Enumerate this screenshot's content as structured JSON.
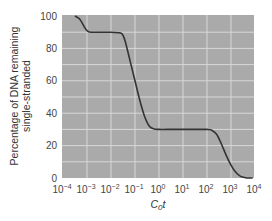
{
  "chart_data": {
    "type": "line",
    "title": "",
    "xlabel": "C0t",
    "ylabel": "Percentage of DNA remaining single-stranded",
    "ylabel_lines": [
      "Percentage of DNA remaining",
      "single-stranded"
    ],
    "x_scale": "log",
    "xlim_log10": [
      -4,
      4
    ],
    "ylim": [
      0,
      100
    ],
    "grid": true,
    "x_ticks": [
      "10^-4",
      "10^-3",
      "10^-2",
      "10^-1",
      "10^0",
      "10^1",
      "10^2",
      "10^3",
      "10^4"
    ],
    "x_tick_exponents": [
      "-4",
      "-3",
      "-2",
      "-1",
      "0",
      "1",
      "2",
      "3",
      "4"
    ],
    "y_ticks": [
      "0",
      "20",
      "40",
      "60",
      "80",
      "100"
    ],
    "series": [
      {
        "name": "Reassociation curve",
        "log10_x": [
          -3.5,
          -3.3,
          -3.1,
          -3.0,
          -2.8,
          -2.0,
          -1.6,
          -1.5,
          -1.4,
          -1.2,
          -1.0,
          -0.8,
          -0.6,
          -0.4,
          -0.2,
          0.0,
          0.5,
          1.0,
          2.0,
          2.2,
          2.4,
          2.6,
          2.8,
          3.0,
          3.2,
          3.4,
          3.6,
          3.8,
          3.9
        ],
        "values": [
          100,
          98,
          93,
          91,
          90,
          90,
          89.5,
          88,
          84,
          72,
          60,
          48,
          38,
          32,
          30.3,
          30,
          30,
          30,
          30,
          29.5,
          27,
          21,
          14,
          8,
          3.5,
          1,
          0.2,
          0,
          0
        ]
      }
    ],
    "colors": {
      "plot_background": "#aaaaaa",
      "gridlines": "#d8d8d8",
      "curve": "#333333"
    }
  }
}
